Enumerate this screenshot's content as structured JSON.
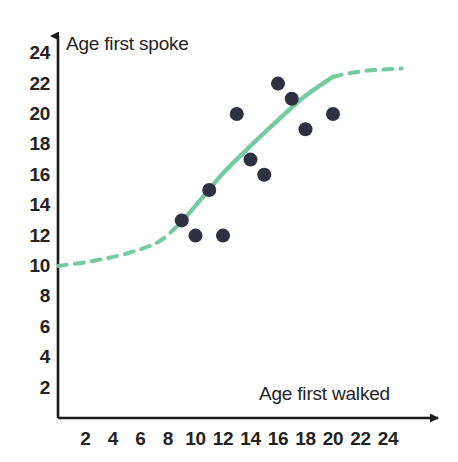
{
  "chart_data": {
    "type": "scatter",
    "title": "",
    "xlabel": "Age first walked",
    "ylabel": "Age first spoke",
    "xlim": [
      0,
      25
    ],
    "ylim": [
      0,
      25
    ],
    "grid": false,
    "legend": "none",
    "x_ticks": [
      2,
      4,
      6,
      8,
      10,
      12,
      14,
      16,
      18,
      20,
      22,
      24
    ],
    "y_ticks": [
      2,
      4,
      6,
      8,
      10,
      12,
      14,
      16,
      18,
      20,
      22,
      24
    ],
    "points": [
      {
        "x": 9,
        "y": 13
      },
      {
        "x": 10,
        "y": 12
      },
      {
        "x": 12,
        "y": 12
      },
      {
        "x": 11,
        "y": 15
      },
      {
        "x": 13,
        "y": 20
      },
      {
        "x": 14,
        "y": 17
      },
      {
        "x": 15,
        "y": 16
      },
      {
        "x": 16,
        "y": 22
      },
      {
        "x": 17,
        "y": 21
      },
      {
        "x": 18,
        "y": 19
      },
      {
        "x": 20,
        "y": 20
      }
    ],
    "point_color": "#2E3140",
    "point_radius": 7,
    "trend_line": {
      "name": "fitted S-curve",
      "color": "#74CBA0",
      "width": 4,
      "dashed_left_segment": [
        {
          "x": 0,
          "y": 10.0
        },
        {
          "x": 2,
          "y": 10.25
        },
        {
          "x": 4,
          "y": 10.6
        },
        {
          "x": 6,
          "y": 11.1
        },
        {
          "x": 7.5,
          "y": 11.7
        },
        {
          "x": 9,
          "y": 12.9
        }
      ],
      "solid_segment": [
        {
          "x": 9,
          "y": 12.9
        },
        {
          "x": 10.5,
          "y": 14.5
        },
        {
          "x": 12,
          "y": 16.1
        },
        {
          "x": 14,
          "y": 17.9
        },
        {
          "x": 16,
          "y": 19.6
        },
        {
          "x": 18,
          "y": 21.2
        },
        {
          "x": 20,
          "y": 22.45
        }
      ],
      "dashed_right_segment": [
        {
          "x": 20,
          "y": 22.45
        },
        {
          "x": 22,
          "y": 22.8
        },
        {
          "x": 25,
          "y": 23.0
        }
      ]
    }
  },
  "axes": {
    "y_axis_title": "Age first spoke",
    "x_axis_title": "Age first walked",
    "y_tick_labels": [
      "24",
      "22",
      "20",
      "18",
      "16",
      "14",
      "12",
      "10",
      "8",
      "6",
      "4",
      "2"
    ],
    "x_tick_labels": [
      "2",
      "4",
      "6",
      "8",
      "10",
      "12",
      "14",
      "16",
      "18",
      "20",
      "22",
      "24"
    ],
    "axis_color": "#1c1c1c"
  }
}
